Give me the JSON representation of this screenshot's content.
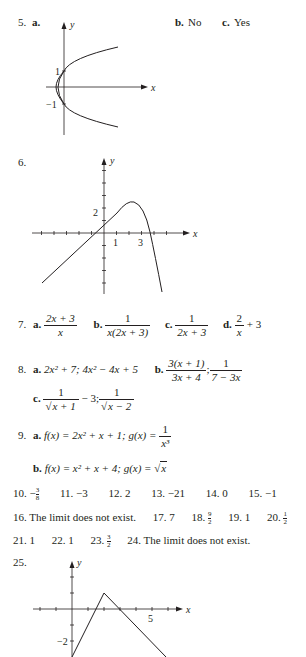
{
  "problems": {
    "p5": {
      "number": "5.",
      "part_a_label": "a.",
      "part_b_label": "b.",
      "part_b_answer": "No",
      "part_c_label": "c.",
      "part_c_answer": "Yes",
      "graph": {
        "x_label": "x",
        "y_label": "y",
        "tick_labels": [
          "1",
          "−1"
        ],
        "curve": "x = y^2 - 1 (parabola opening right)"
      }
    },
    "p6": {
      "number": "6.",
      "graph": {
        "x_label": "x",
        "y_label": "y",
        "x_tick_labels": [
          "1",
          "3"
        ],
        "y_tick_labels": [
          "2"
        ]
      }
    },
    "p7": {
      "number": "7.",
      "a": {
        "label": "a.",
        "num": "2x + 3",
        "den": "x"
      },
      "b": {
        "label": "b.",
        "num": "1",
        "den": "x(2x + 3)"
      },
      "c": {
        "label": "c.",
        "num": "1",
        "den": "2x + 3"
      },
      "d": {
        "label": "d.",
        "num": "2",
        "den": "x",
        "rest": "+ 3"
      }
    },
    "p8": {
      "number": "8.",
      "a": {
        "label": "a.",
        "text": "2x² + 7; 4x² − 4x + 5"
      },
      "b": {
        "label": "b.",
        "num1": "3(x + 1)",
        "den1": "3x + 4",
        "sep": ";",
        "num2": "1",
        "den2": "7 − 3x"
      },
      "c": {
        "label": "c.",
        "num1": "1",
        "den1_rad": "x + 1",
        "rest1": "− 3;",
        "num2": "1",
        "den2_rad": "x − 2"
      }
    },
    "p9": {
      "number": "9.",
      "a": {
        "label": "a.",
        "text": "f(x) = 2x² + x + 1; g(x) =",
        "num": "1",
        "den": "x³"
      },
      "b": {
        "label": "b.",
        "text": "f(x) = x² + x + 4; g(x) =",
        "rad": "x"
      }
    },
    "row10": [
      {
        "number": "10.",
        "answer_prefix": "−",
        "frac_num": "3",
        "frac_den": "8"
      },
      {
        "number": "11.",
        "answer": "−3"
      },
      {
        "number": "12.",
        "answer": "2"
      },
      {
        "number": "13.",
        "answer": "−21"
      },
      {
        "number": "14.",
        "answer": "0"
      },
      {
        "number": "15.",
        "answer": "−1"
      }
    ],
    "row16": [
      {
        "number": "16.",
        "answer": "The limit does not exist."
      },
      {
        "number": "17.",
        "answer": "7"
      },
      {
        "number": "18.",
        "frac_num": "9",
        "frac_den": "2"
      },
      {
        "number": "19.",
        "answer": "1"
      },
      {
        "number": "20.",
        "frac_num": "1",
        "frac_den": "2"
      }
    ],
    "row21": [
      {
        "number": "21.",
        "answer": "1"
      },
      {
        "number": "22.",
        "answer": "1"
      },
      {
        "number": "23.",
        "frac_num": "3",
        "frac_den": "2"
      },
      {
        "number": "24.",
        "answer": "The limit does not exist."
      }
    ],
    "p25": {
      "number": "25.",
      "graph": {
        "x_label": "x",
        "y_label": "y",
        "x_tick_labels": [
          "5"
        ],
        "y_tick_labels": [
          "−2"
        ]
      }
    }
  }
}
